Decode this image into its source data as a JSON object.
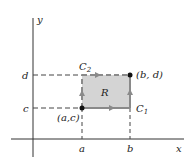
{
  "diagram": {
    "axes": {
      "x_label": "x",
      "y_label": "y"
    },
    "ticks": {
      "a": "a",
      "b": "b",
      "c": "c",
      "d": "d"
    },
    "region_label": "R",
    "curves": {
      "c1": "C",
      "c1_sub": "1",
      "c2": "C",
      "c2_sub": "2"
    },
    "points": {
      "lower_left": "(a,c)",
      "upper_right": "(b, d)"
    },
    "colors": {
      "region_fill": "#d4d4d4",
      "boundary": "#8a8a8a",
      "axis": "#333333",
      "dash": "#444444"
    }
  }
}
